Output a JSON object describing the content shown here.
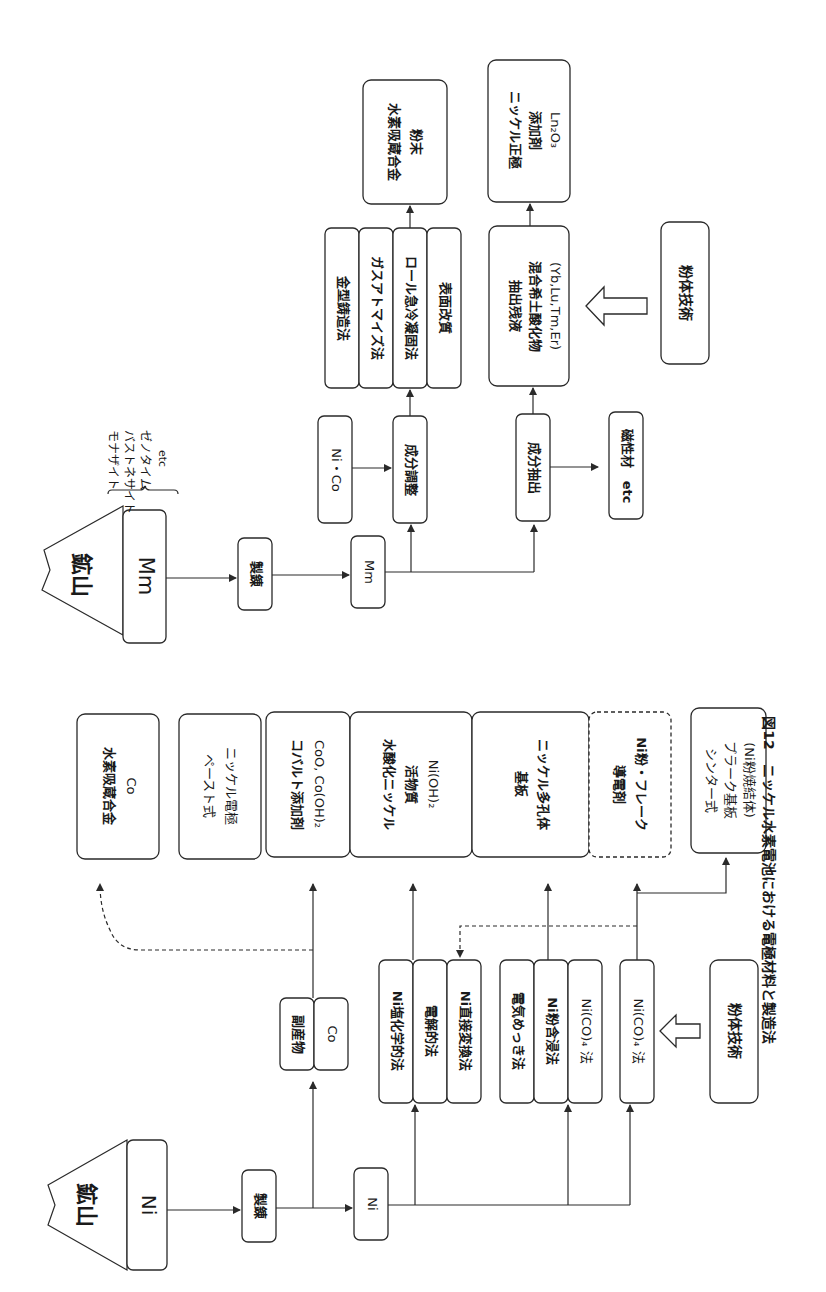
{
  "caption": "図12　ニッケル水素電池における電極材料と製造法",
  "ni_chain": {
    "mine_label": "鉱山",
    "mine_metal": "Ni",
    "refining": "製錬",
    "ni_node": "Ni",
    "byproduct": "副産物",
    "byproduct_metal": "Co",
    "group1": [
      "Ni塩化学的法",
      "電解的法",
      "Ni直接変換法"
    ],
    "group2": [
      "電気めっき法",
      "Ni粉含浸法",
      "Ni(CO)₄ 法"
    ],
    "group3": [
      "Ni(CO)₄ 法"
    ],
    "powder_tech": "粉体技術",
    "products": {
      "hydrogen_alloy": [
        "水素吸蔵合金",
        "Co"
      ],
      "paste_electrode": [
        "ペースト式",
        "ニッケル電極"
      ],
      "cobalt_additive": [
        "コバルト添加剤",
        "CoO, Co(OH)₂"
      ],
      "active_material": [
        "水酸化ニッケル",
        "活物質",
        "Ni(OH)₂"
      ],
      "substrate": [
        "基板",
        "ニッケル多孔体"
      ],
      "conductive_agent": [
        "導電剤",
        "Ni粉・フレーク"
      ],
      "sinter_plate": [
        "シンター式",
        "プラーク基板",
        "(Ni粉焼結体)"
      ]
    }
  },
  "mm_chain": {
    "mine_label": "鉱山",
    "mine_metal": "Mm",
    "ores": [
      "モナザイト",
      "バストネサイト",
      "ゼノタイム",
      "etc"
    ],
    "refining": "製錬",
    "mm_node": "Mm",
    "ni_co": "Ni・Co",
    "composition_adjust": "成分調整",
    "methods": [
      "金型鋳造法",
      "ガスアトマイズ法",
      "ロール急冷凝固法",
      "表面改質"
    ],
    "alloy_powder": [
      "水素吸蔵合金",
      "粉末"
    ],
    "extraction": "成分抽出",
    "magnetic": "磁性材　etc",
    "residue": [
      "抽出残液",
      "混合希土酸化物",
      "(Yb,Lu,Tm,Er)"
    ],
    "positive_additive": [
      "ニッケル正極",
      "添加剤",
      "Ln₂O₃"
    ],
    "powder_tech": "粉体技術"
  }
}
